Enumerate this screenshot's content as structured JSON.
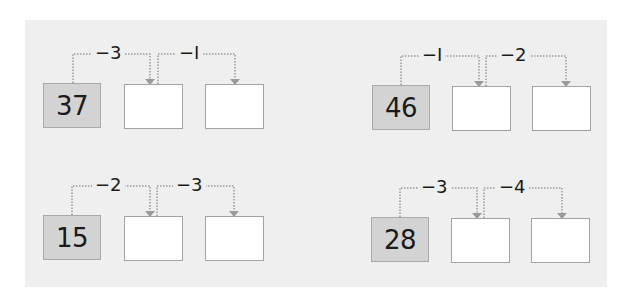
{
  "worksheet": {
    "problems": [
      {
        "start": "37",
        "steps": [
          "−3",
          "−I"
        ],
        "answers": [
          "",
          ""
        ]
      },
      {
        "start": "46",
        "steps": [
          "−I",
          "−2"
        ],
        "answers": [
          "",
          ""
        ]
      },
      {
        "start": "15",
        "steps": [
          "−2",
          "−3"
        ],
        "answers": [
          "",
          ""
        ]
      },
      {
        "start": "28",
        "steps": [
          "−3",
          "−4"
        ],
        "answers": [
          "",
          ""
        ]
      }
    ]
  },
  "colors": {
    "panel_bg": "#efefef",
    "start_box_fill": "#d3d3d3",
    "start_box_border": "#a9a9a9",
    "answer_box_border": "#a3a3a3",
    "connector": "#9a9a9a"
  }
}
